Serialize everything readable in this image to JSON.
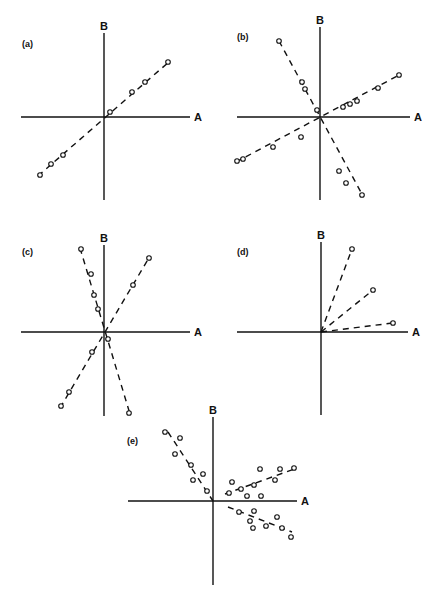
{
  "figure": {
    "caption_visible_fragment": "",
    "axis_x_label": "A",
    "axis_y_label": "B"
  },
  "chart_data": [
    {
      "type": "scatter",
      "panel": "(a)",
      "title": "(a)",
      "xlabel": "A",
      "ylabel": "B",
      "origin_px": [
        104,
        117
      ],
      "x_axis_px": [
        21,
        190
      ],
      "y_axis_px": [
        33,
        200
      ],
      "label_px": [
        22,
        47
      ],
      "series": [
        {
          "name": "line-1",
          "trend": [
            [
              38,
              176
            ],
            [
              170,
              61
            ]
          ],
          "points": [
            [
              40,
              175
            ],
            [
              51,
              164
            ],
            [
              63,
              155
            ],
            [
              110,
              112
            ],
            [
              132,
              92
            ],
            [
              145,
              82
            ],
            [
              168,
              62
            ]
          ]
        }
      ]
    },
    {
      "type": "scatter",
      "panel": "(b)",
      "title": "(b)",
      "xlabel": "A",
      "ylabel": "B",
      "origin_px": [
        320,
        117
      ],
      "x_axis_px": [
        237,
        410
      ],
      "y_axis_px": [
        27,
        200
      ],
      "label_px": [
        237,
        40
      ],
      "series": [
        {
          "name": "line-positive",
          "trend": [
            [
              236,
              162
            ],
            [
              401,
              74
            ]
          ],
          "points": [
            [
              237,
              161
            ],
            [
              243,
              159
            ],
            [
              273,
              147
            ],
            [
              301,
              137
            ],
            [
              343,
              107
            ],
            [
              350,
              104
            ],
            [
              357,
              101
            ],
            [
              378,
              88
            ],
            [
              399,
              75
            ]
          ]
        },
        {
          "name": "line-negative",
          "trend": [
            [
              279,
              41
            ],
            [
              363,
              196
            ]
          ],
          "points": [
            [
              279,
              41
            ],
            [
              302,
              82
            ],
            [
              305,
              89
            ],
            [
              317,
              110
            ],
            [
              339,
              171
            ],
            [
              346,
              183
            ],
            [
              362,
              195
            ]
          ]
        }
      ]
    },
    {
      "type": "scatter",
      "panel": "(c)",
      "title": "(c)",
      "xlabel": "A",
      "ylabel": "B",
      "origin_px": [
        104,
        332
      ],
      "x_axis_px": [
        21,
        190
      ],
      "y_axis_px": [
        245,
        416
      ],
      "label_px": [
        22,
        255
      ],
      "series": [
        {
          "name": "line-steep-positive",
          "trend": [
            [
              60,
              408
            ],
            [
              150,
              256
            ]
          ],
          "points": [
            [
              61,
              406
            ],
            [
              69,
              392
            ],
            [
              92,
              352
            ],
            [
              133,
              285
            ],
            [
              149,
              258
            ]
          ]
        },
        {
          "name": "line-steep-negative",
          "trend": [
            [
              80,
              248
            ],
            [
              130,
              414
            ]
          ],
          "points": [
            [
              81,
              249
            ],
            [
              91,
              274
            ],
            [
              94,
              295
            ],
            [
              98,
              309
            ],
            [
              108,
              339
            ],
            [
              129,
              413
            ]
          ]
        }
      ]
    },
    {
      "type": "scatter",
      "panel": "(d)",
      "title": "(d)",
      "xlabel": "A",
      "ylabel": "B",
      "origin_px": [
        321,
        332
      ],
      "x_axis_px": [
        237,
        408
      ],
      "y_axis_px": [
        242,
        415
      ],
      "label_px": [
        237,
        255
      ],
      "series": [
        {
          "name": "ray-steep",
          "trend": [
            [
              321,
              332
            ],
            [
              352,
              249
            ]
          ],
          "points": [
            [
              352,
              249
            ]
          ]
        },
        {
          "name": "ray-medium",
          "trend": [
            [
              321,
              332
            ],
            [
              373,
              290
            ]
          ],
          "points": [
            [
              373,
              290
            ]
          ]
        },
        {
          "name": "ray-shallow",
          "trend": [
            [
              321,
              332
            ],
            [
              393,
              323
            ]
          ],
          "points": [
            [
              393,
              323
            ]
          ]
        }
      ]
    },
    {
      "type": "scatter",
      "panel": "(e)",
      "title": "(e)",
      "xlabel": "A",
      "ylabel": "B",
      "origin_px": [
        213,
        501
      ],
      "x_axis_px": [
        128,
        297
      ],
      "y_axis_px": [
        417,
        585
      ],
      "label_px": [
        127,
        444
      ],
      "series": [
        {
          "name": "cluster-upper-left",
          "trend": [
            [
              168,
              432
            ],
            [
              213,
              501
            ]
          ],
          "points": [
            [
              165,
              432
            ],
            [
              180,
              438
            ],
            [
              175,
              454
            ],
            [
              191,
              465
            ],
            [
              203,
              474
            ],
            [
              193,
              480
            ],
            [
              207,
              491
            ]
          ]
        },
        {
          "name": "cluster-upper-right",
          "trend": [
            [
              225,
              494
            ],
            [
              297,
              468
            ]
          ],
          "points": [
            [
              229,
              493
            ],
            [
              232,
              482
            ],
            [
              241,
              489
            ],
            [
              247,
              496
            ],
            [
              254,
              485
            ],
            [
              260,
              469
            ],
            [
              261,
              496
            ],
            [
              275,
              480
            ],
            [
              280,
              469
            ],
            [
              294,
              468
            ]
          ]
        },
        {
          "name": "cluster-lower-right",
          "trend": [
            [
              228,
              507
            ],
            [
              292,
              532
            ]
          ],
          "points": [
            [
              239,
              512
            ],
            [
              250,
              521
            ],
            [
              254,
              511
            ],
            [
              253,
              528
            ],
            [
              266,
              526
            ],
            [
              277,
              517
            ],
            [
              282,
              528
            ],
            [
              291,
              537
            ]
          ]
        }
      ]
    }
  ]
}
